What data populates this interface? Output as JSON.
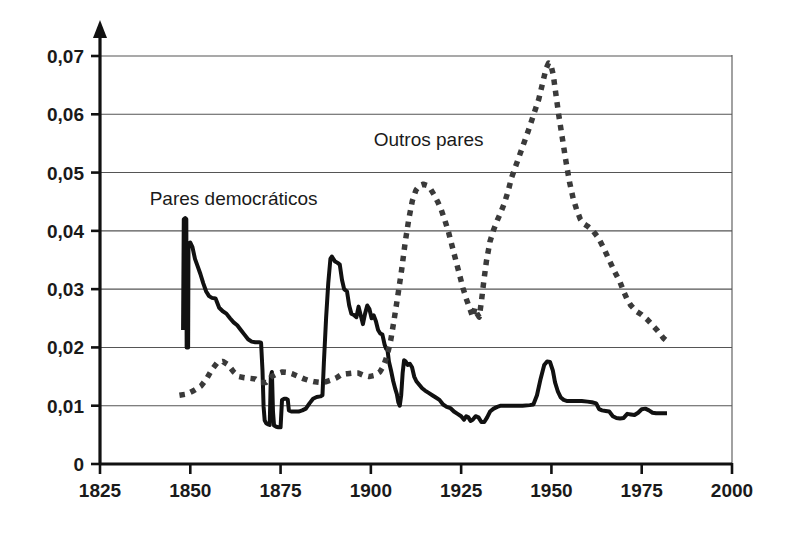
{
  "chart_data": {
    "type": "line",
    "title": "",
    "xlabel": "",
    "ylabel": "",
    "xlim": [
      1825,
      2000
    ],
    "ylim": [
      0,
      0.07
    ],
    "grid": true,
    "legend_position": "inline-annotations",
    "decimal_separator": ",",
    "x_ticks": [
      1825,
      1850,
      1875,
      1900,
      1925,
      1950,
      1975,
      2000
    ],
    "x_tick_labels": [
      "1825",
      "1850",
      "1875",
      "1900",
      "1925",
      "1950",
      "1975",
      "2000"
    ],
    "y_ticks": [
      0,
      0.01,
      0.02,
      0.03,
      0.04,
      0.05,
      0.06,
      0.07
    ],
    "y_tick_labels": [
      "0",
      "0,01",
      "0,02",
      "0,03",
      "0,04",
      "0,05",
      "0,06",
      "0,07"
    ],
    "annotations": [
      {
        "text": "Pares democráticos",
        "x": 1862,
        "y": 0.0445
      },
      {
        "text": "Outros pares",
        "x": 1916,
        "y": 0.0545
      }
    ],
    "series": [
      {
        "name": "Pares democráticos",
        "style": "solid",
        "color": "#111111",
        "points": [
          [
            1848.0,
            0.023
          ],
          [
            1848.2,
            0.042
          ],
          [
            1848.6,
            0.0422
          ],
          [
            1848.9,
            0.042
          ],
          [
            1849.0,
            0.02
          ],
          [
            1849.4,
            0.02
          ],
          [
            1849.5,
            0.0378
          ],
          [
            1850.0,
            0.038
          ],
          [
            1850.6,
            0.0372
          ],
          [
            1851.3,
            0.0352
          ],
          [
            1852.0,
            0.034
          ],
          [
            1852.8,
            0.0326
          ],
          [
            1853.6,
            0.031
          ],
          [
            1854.4,
            0.0296
          ],
          [
            1855.2,
            0.0288
          ],
          [
            1856.0,
            0.0285
          ],
          [
            1857.0,
            0.0284
          ],
          [
            1858.0,
            0.0268
          ],
          [
            1859.0,
            0.0262
          ],
          [
            1860.0,
            0.0258
          ],
          [
            1861.0,
            0.025
          ],
          [
            1862.0,
            0.0243
          ],
          [
            1863.0,
            0.0238
          ],
          [
            1864.0,
            0.023
          ],
          [
            1865.0,
            0.0222
          ],
          [
            1866.0,
            0.0214
          ],
          [
            1867.0,
            0.021
          ],
          [
            1868.0,
            0.0209
          ],
          [
            1869.0,
            0.0209
          ],
          [
            1869.6,
            0.0208
          ],
          [
            1870.0,
            0.016
          ],
          [
            1870.3,
            0.0098
          ],
          [
            1870.6,
            0.0075
          ],
          [
            1871.0,
            0.007
          ],
          [
            1871.6,
            0.0068
          ],
          [
            1872.0,
            0.0067
          ],
          [
            1872.3,
            0.015
          ],
          [
            1872.6,
            0.0158
          ],
          [
            1872.9,
            0.009
          ],
          [
            1873.2,
            0.0066
          ],
          [
            1873.8,
            0.0064
          ],
          [
            1874.4,
            0.0063
          ],
          [
            1875.0,
            0.0063
          ],
          [
            1875.4,
            0.011
          ],
          [
            1876.0,
            0.0112
          ],
          [
            1876.6,
            0.0112
          ],
          [
            1877.0,
            0.011
          ],
          [
            1877.3,
            0.0092
          ],
          [
            1878.0,
            0.009
          ],
          [
            1879.0,
            0.009
          ],
          [
            1880.0,
            0.009
          ],
          [
            1881.0,
            0.0092
          ],
          [
            1882.0,
            0.0095
          ],
          [
            1883.0,
            0.0104
          ],
          [
            1884.0,
            0.0112
          ],
          [
            1885.0,
            0.0115
          ],
          [
            1886.0,
            0.0116
          ],
          [
            1886.6,
            0.0118
          ],
          [
            1887.0,
            0.0175
          ],
          [
            1887.6,
            0.025
          ],
          [
            1888.2,
            0.031
          ],
          [
            1888.8,
            0.0352
          ],
          [
            1889.2,
            0.0356
          ],
          [
            1890.0,
            0.0348
          ],
          [
            1890.8,
            0.0345
          ],
          [
            1891.4,
            0.0342
          ],
          [
            1892.0,
            0.0316
          ],
          [
            1892.6,
            0.03
          ],
          [
            1893.4,
            0.0296
          ],
          [
            1894.0,
            0.0272
          ],
          [
            1894.6,
            0.0258
          ],
          [
            1895.2,
            0.0256
          ],
          [
            1896.0,
            0.0252
          ],
          [
            1896.6,
            0.027
          ],
          [
            1897.2,
            0.0255
          ],
          [
            1897.8,
            0.024
          ],
          [
            1898.4,
            0.0258
          ],
          [
            1899.0,
            0.0272
          ],
          [
            1899.6,
            0.0266
          ],
          [
            1900.2,
            0.025
          ],
          [
            1900.8,
            0.0255
          ],
          [
            1901.4,
            0.0245
          ],
          [
            1902.0,
            0.023
          ],
          [
            1902.6,
            0.0224
          ],
          [
            1903.2,
            0.0222
          ],
          [
            1903.8,
            0.0205
          ],
          [
            1904.2,
            0.0198
          ],
          [
            1904.6,
            0.0196
          ],
          [
            1905.0,
            0.0176
          ],
          [
            1905.6,
            0.016
          ],
          [
            1906.2,
            0.0142
          ],
          [
            1906.8,
            0.0128
          ],
          [
            1907.2,
            0.012
          ],
          [
            1907.6,
            0.0106
          ],
          [
            1908.0,
            0.01
          ],
          [
            1908.4,
            0.0118
          ],
          [
            1908.8,
            0.0156
          ],
          [
            1909.2,
            0.0178
          ],
          [
            1909.6,
            0.0176
          ],
          [
            1910.2,
            0.017
          ],
          [
            1910.8,
            0.0172
          ],
          [
            1911.4,
            0.0166
          ],
          [
            1912.0,
            0.015
          ],
          [
            1912.6,
            0.0142
          ],
          [
            1913.4,
            0.0136
          ],
          [
            1914.2,
            0.013
          ],
          [
            1915.0,
            0.0126
          ],
          [
            1916.0,
            0.0122
          ],
          [
            1917.0,
            0.0118
          ],
          [
            1918.0,
            0.0114
          ],
          [
            1919.0,
            0.011
          ],
          [
            1920.0,
            0.0102
          ],
          [
            1921.0,
            0.0098
          ],
          [
            1922.0,
            0.0096
          ],
          [
            1923.0,
            0.009
          ],
          [
            1924.0,
            0.0086
          ],
          [
            1925.0,
            0.0082
          ],
          [
            1925.8,
            0.0076
          ],
          [
            1926.4,
            0.0082
          ],
          [
            1927.0,
            0.008
          ],
          [
            1927.6,
            0.0074
          ],
          [
            1928.2,
            0.0076
          ],
          [
            1929.0,
            0.0082
          ],
          [
            1929.8,
            0.008
          ],
          [
            1930.6,
            0.0072
          ],
          [
            1931.4,
            0.0072
          ],
          [
            1932.2,
            0.008
          ],
          [
            1933.0,
            0.009
          ],
          [
            1934.0,
            0.0095
          ],
          [
            1935.0,
            0.0098
          ],
          [
            1936.0,
            0.01
          ],
          [
            1937.0,
            0.01
          ],
          [
            1938.0,
            0.01
          ],
          [
            1940.0,
            0.01
          ],
          [
            1942.0,
            0.01
          ],
          [
            1944.0,
            0.0101
          ],
          [
            1945.0,
            0.0102
          ],
          [
            1946.0,
            0.0118
          ],
          [
            1947.0,
            0.0146
          ],
          [
            1948.0,
            0.017
          ],
          [
            1948.8,
            0.0176
          ],
          [
            1949.6,
            0.0175
          ],
          [
            1950.4,
            0.016
          ],
          [
            1951.0,
            0.014
          ],
          [
            1951.8,
            0.0124
          ],
          [
            1952.6,
            0.0114
          ],
          [
            1953.4,
            0.011
          ],
          [
            1954.4,
            0.0108
          ],
          [
            1955.6,
            0.0108
          ],
          [
            1957.0,
            0.0108
          ],
          [
            1958.4,
            0.0108
          ],
          [
            1960.0,
            0.0107
          ],
          [
            1961.2,
            0.0106
          ],
          [
            1962.4,
            0.0104
          ],
          [
            1963.2,
            0.0094
          ],
          [
            1964.0,
            0.0092
          ],
          [
            1965.0,
            0.0091
          ],
          [
            1966.0,
            0.009
          ],
          [
            1967.0,
            0.0082
          ],
          [
            1968.0,
            0.0079
          ],
          [
            1969.0,
            0.0078
          ],
          [
            1970.0,
            0.0079
          ],
          [
            1971.0,
            0.0086
          ],
          [
            1972.0,
            0.0085
          ],
          [
            1973.0,
            0.0084
          ],
          [
            1974.0,
            0.0088
          ],
          [
            1975.0,
            0.0094
          ],
          [
            1976.0,
            0.0095
          ],
          [
            1977.0,
            0.0092
          ],
          [
            1978.0,
            0.0088
          ],
          [
            1979.0,
            0.0087
          ],
          [
            1980.0,
            0.0087
          ],
          [
            1982.0,
            0.0087
          ]
        ]
      },
      {
        "name": "Outros pares",
        "style": "dotted",
        "color": "#3a3a3a",
        "points": [
          [
            1847.0,
            0.0118
          ],
          [
            1849.0,
            0.012
          ],
          [
            1851.0,
            0.0126
          ],
          [
            1853.0,
            0.0134
          ],
          [
            1854.5,
            0.0146
          ],
          [
            1856.0,
            0.0162
          ],
          [
            1857.5,
            0.0174
          ],
          [
            1859.0,
            0.0176
          ],
          [
            1860.5,
            0.017
          ],
          [
            1862.0,
            0.0158
          ],
          [
            1863.5,
            0.015
          ],
          [
            1865.0,
            0.0148
          ],
          [
            1866.5,
            0.0147
          ],
          [
            1868.0,
            0.0146
          ],
          [
            1869.5,
            0.014
          ],
          [
            1871.0,
            0.014
          ],
          [
            1872.5,
            0.015
          ],
          [
            1874.0,
            0.0155
          ],
          [
            1875.5,
            0.0158
          ],
          [
            1877.0,
            0.0157
          ],
          [
            1878.5,
            0.0154
          ],
          [
            1880.0,
            0.015
          ],
          [
            1881.5,
            0.0146
          ],
          [
            1883.0,
            0.0143
          ],
          [
            1884.5,
            0.0141
          ],
          [
            1886.0,
            0.014
          ],
          [
            1887.5,
            0.0141
          ],
          [
            1889.0,
            0.0144
          ],
          [
            1890.5,
            0.0148
          ],
          [
            1892.0,
            0.0154
          ],
          [
            1893.5,
            0.0155
          ],
          [
            1895.0,
            0.0156
          ],
          [
            1896.5,
            0.0156
          ],
          [
            1898.0,
            0.0152
          ],
          [
            1899.5,
            0.015
          ],
          [
            1901.0,
            0.0152
          ],
          [
            1902.5,
            0.0158
          ],
          [
            1903.5,
            0.0168
          ],
          [
            1904.5,
            0.0186
          ],
          [
            1905.5,
            0.0212
          ],
          [
            1906.5,
            0.025
          ],
          [
            1907.5,
            0.029
          ],
          [
            1908.5,
            0.0332
          ],
          [
            1909.5,
            0.038
          ],
          [
            1910.5,
            0.042
          ],
          [
            1911.5,
            0.0452
          ],
          [
            1912.5,
            0.047
          ],
          [
            1913.5,
            0.0478
          ],
          [
            1914.5,
            0.048
          ],
          [
            1915.5,
            0.0478
          ],
          [
            1916.5,
            0.0472
          ],
          [
            1917.5,
            0.0462
          ],
          [
            1918.5,
            0.045
          ],
          [
            1919.5,
            0.0436
          ],
          [
            1920.5,
            0.0418
          ],
          [
            1921.5,
            0.0398
          ],
          [
            1922.5,
            0.0374
          ],
          [
            1923.5,
            0.035
          ],
          [
            1924.5,
            0.0326
          ],
          [
            1925.5,
            0.0302
          ],
          [
            1926.5,
            0.0282
          ],
          [
            1927.5,
            0.0265
          ],
          [
            1928.2,
            0.0252
          ],
          [
            1928.8,
            0.0268
          ],
          [
            1929.4,
            0.0258
          ],
          [
            1930.0,
            0.0252
          ],
          [
            1930.6,
            0.0278
          ],
          [
            1931.2,
            0.031
          ],
          [
            1932.0,
            0.0348
          ],
          [
            1933.0,
            0.0382
          ],
          [
            1934.0,
            0.0402
          ],
          [
            1935.0,
            0.0418
          ],
          [
            1936.0,
            0.0432
          ],
          [
            1937.0,
            0.0448
          ],
          [
            1938.0,
            0.0468
          ],
          [
            1939.0,
            0.0492
          ],
          [
            1940.5,
            0.0518
          ],
          [
            1942.0,
            0.0544
          ],
          [
            1943.5,
            0.057
          ],
          [
            1945.0,
            0.0598
          ],
          [
            1946.5,
            0.0626
          ],
          [
            1947.5,
            0.0652
          ],
          [
            1948.5,
            0.0678
          ],
          [
            1949.2,
            0.0688
          ],
          [
            1949.8,
            0.0686
          ],
          [
            1950.5,
            0.0668
          ],
          [
            1951.2,
            0.0636
          ],
          [
            1952.0,
            0.06
          ],
          [
            1953.0,
            0.056
          ],
          [
            1954.0,
            0.052
          ],
          [
            1955.0,
            0.0484
          ],
          [
            1956.0,
            0.0456
          ],
          [
            1957.0,
            0.0436
          ],
          [
            1958.0,
            0.042
          ],
          [
            1959.0,
            0.0412
          ],
          [
            1960.0,
            0.0408
          ],
          [
            1961.5,
            0.04
          ],
          [
            1963.0,
            0.0388
          ],
          [
            1964.5,
            0.037
          ],
          [
            1966.0,
            0.035
          ],
          [
            1967.5,
            0.033
          ],
          [
            1969.0,
            0.0312
          ],
          [
            1970.0,
            0.0296
          ],
          [
            1971.0,
            0.0282
          ],
          [
            1972.0,
            0.0272
          ],
          [
            1973.5,
            0.0262
          ],
          [
            1975.0,
            0.0256
          ],
          [
            1976.5,
            0.0248
          ],
          [
            1978.0,
            0.0238
          ],
          [
            1979.5,
            0.0228
          ],
          [
            1981.0,
            0.0216
          ],
          [
            1982.5,
            0.0208
          ]
        ]
      }
    ]
  }
}
